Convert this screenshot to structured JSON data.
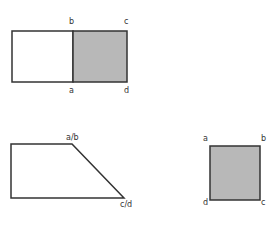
{
  "figures": {
    "top_rect": {
      "labels": {
        "b": "b",
        "c": "c",
        "a": "a",
        "d": "d"
      },
      "fill_shaded": "#b8b8b8",
      "stroke": "#333333"
    },
    "trapezoid": {
      "labels": {
        "ab": "a/b",
        "cd": "c/d"
      },
      "stroke": "#333333"
    },
    "square": {
      "labels": {
        "a": "a",
        "b": "b",
        "d": "d",
        "c": "c"
      },
      "fill_shaded": "#b8b8b8",
      "stroke": "#333333"
    }
  }
}
